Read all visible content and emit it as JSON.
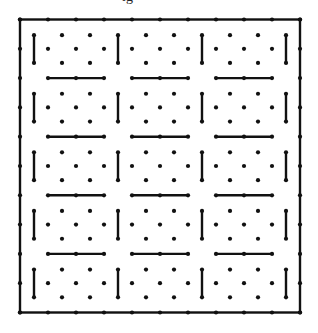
{
  "figure": {
    "caption_fragment": "ig",
    "colors": {
      "ink": "#111111",
      "background": "#ffffff"
    },
    "frame": {
      "x0": 20,
      "y0": 19.5,
      "x1": 300,
      "y1": 312.5
    },
    "lattice": {
      "col_spacing": 28,
      "row_spacing": 29.3,
      "cols": 10,
      "rows": 10
    },
    "blocks": {
      "col_blocks": 4,
      "row_blocks": 5,
      "block_width": 84,
      "block_height": 58.6
    },
    "dot_radius": 2.1,
    "stroke_width": 2.4
  }
}
